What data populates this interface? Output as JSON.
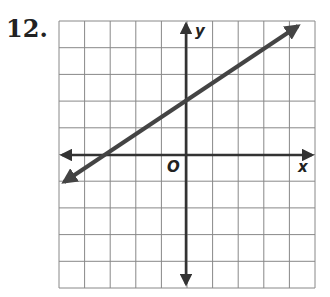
{
  "problem": {
    "number": "12."
  },
  "graph": {
    "x_label": "x",
    "y_label": "y",
    "origin_label": "O",
    "grid": {
      "cols": 10,
      "rows": 10,
      "x_range": [
        -5,
        5
      ],
      "y_range": [
        -5,
        5
      ]
    },
    "line": {
      "slope": 0.6667,
      "y_intercept": 2,
      "x_intercept": -3,
      "points": [
        [
          -3,
          0
        ],
        [
          0,
          2
        ]
      ],
      "equation": "y = 2/3 x + 2"
    },
    "colors": {
      "grid": "#888888",
      "axes": "#333333",
      "line": "#444444"
    }
  },
  "chart_data": {
    "type": "line",
    "title": "12.",
    "xlabel": "x",
    "ylabel": "y",
    "xlim": [
      -5,
      5
    ],
    "ylim": [
      -5,
      5
    ],
    "grid": true,
    "series": [
      {
        "name": "line",
        "x": [
          -5,
          -3,
          0,
          4.5
        ],
        "y": [
          -1.33,
          0,
          2,
          5
        ]
      }
    ]
  }
}
